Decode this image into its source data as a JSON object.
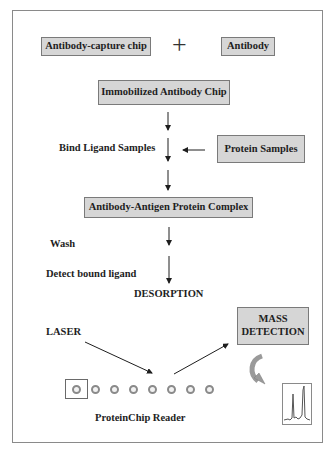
{
  "diagram": {
    "boxes": {
      "capture_chip": "Antibody-capture chip",
      "antibody": "Antibody",
      "immobilized": "Immobilized Antibody Chip",
      "protein_samples": "Protein Samples",
      "complex": "Antibody-Antigen Protein Complex",
      "mass_detection_line1": "MASS",
      "mass_detection_line2": "DETECTION"
    },
    "labels": {
      "plus": "+",
      "bind": "Bind Ligand Samples",
      "wash": "Wash",
      "detect": "Detect bound ligand",
      "desorption": "DESORPTION",
      "laser": "LASER",
      "reader": "ProteinChip Reader"
    },
    "chip_spots": 8,
    "icons": {
      "curved_arrow": "curved-arrow-icon",
      "spectrum": "mass-spectrum-icon"
    },
    "colors": {
      "box_fill": "#d6d6d6",
      "box_border": "#7a7a7a",
      "text": "#1e1e1e",
      "frame": "#8a8a8a"
    }
  }
}
